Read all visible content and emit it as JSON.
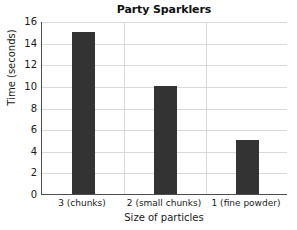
{
  "chart_data": {
    "type": "bar",
    "title": "Party Sparklers",
    "xlabel": "Size of particles",
    "ylabel": "Time (seconds)",
    "categories": [
      "3 (chunks)",
      "2 (small chunks)",
      "1 (fine powder)"
    ],
    "values": [
      15,
      10,
      5
    ],
    "ylim": [
      0,
      16
    ],
    "yticks": [
      0,
      2,
      4,
      6,
      8,
      10,
      12,
      14,
      16
    ],
    "ytick_labels": [
      "0",
      "2",
      "4",
      "6",
      "8",
      "10",
      "12",
      "14",
      "16"
    ],
    "grid": "horizontal-and-category-separators",
    "legend": "none",
    "bar_color": "#333333",
    "grid_color": "#d9d9d9",
    "axis_color": "#4d4d4d",
    "background_color": "#ffffff"
  }
}
